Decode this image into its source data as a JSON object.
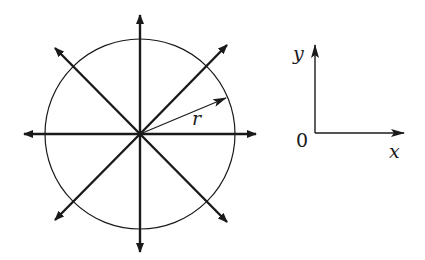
{
  "diagram": {
    "circle": {
      "cx": 140,
      "cy": 134,
      "r": 95
    },
    "radius_label": "r",
    "axes_labels": {
      "y": "y",
      "x": "x",
      "origin": "0"
    },
    "colors": {
      "stroke": "#1a1a1a",
      "background": "#ffffff"
    }
  }
}
